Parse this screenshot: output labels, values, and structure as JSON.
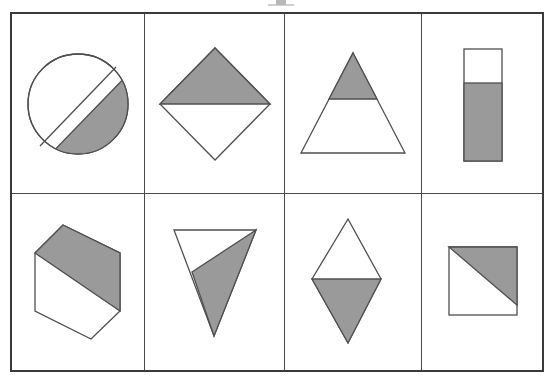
{
  "page": {
    "background_color": "#ffffff",
    "border_color": "#3a3a3a",
    "grid_line_color": "#4a4a4a",
    "shaded_color": "#9a9a9a",
    "unshaded_color": "#ffffff",
    "outline_color": "#4f4f4f",
    "columns": 4,
    "rows": 2
  },
  "cells": [
    {
      "id": "cell-1",
      "position": "row-1-col-1",
      "shape": "circle",
      "shape_label": "Circle",
      "partition": "diagonal chord",
      "shaded_fraction": "1/2",
      "shaded_region": "lower-right"
    },
    {
      "id": "cell-2",
      "position": "row-1-col-2",
      "shape": "diamond",
      "shape_label": "Rotated square (diamond)",
      "partition": "horizontal diagonal",
      "shaded_fraction": "1/2",
      "shaded_region": "top"
    },
    {
      "id": "cell-3",
      "position": "row-1-col-3",
      "shape": "triangle",
      "shape_label": "Triangle",
      "partition": "horizontal line",
      "shaded_fraction": "1/4",
      "shaded_region": "top"
    },
    {
      "id": "cell-4",
      "position": "row-1-col-4",
      "shape": "rectangle",
      "shape_label": "Vertical rectangle",
      "partition": "horizontal line",
      "shaded_fraction": "2/3",
      "shaded_region": "bottom"
    },
    {
      "id": "cell-5",
      "position": "row-2-col-1",
      "shape": "hexagon",
      "shape_label": "Hexagon",
      "partition": "diagonal line",
      "shaded_fraction": "1/2",
      "shaded_region": "upper-right"
    },
    {
      "id": "cell-6",
      "position": "row-2-col-2",
      "shape": "inverted-triangle",
      "shape_label": "Inverted triangle",
      "partition": "diagonal line",
      "shaded_fraction": "3/4",
      "shaded_region": "lower-right"
    },
    {
      "id": "cell-7",
      "position": "row-2-col-3",
      "shape": "rhombus",
      "shape_label": "Rhombus (kite)",
      "partition": "horizontal diagonal",
      "shaded_fraction": "1/2",
      "shaded_region": "bottom"
    },
    {
      "id": "cell-8",
      "position": "row-2-col-4",
      "shape": "square",
      "shape_label": "Square",
      "partition": "diagonal from top-left to bottom-right",
      "shaded_fraction": "1/2",
      "shaded_region": "upper-right"
    }
  ]
}
